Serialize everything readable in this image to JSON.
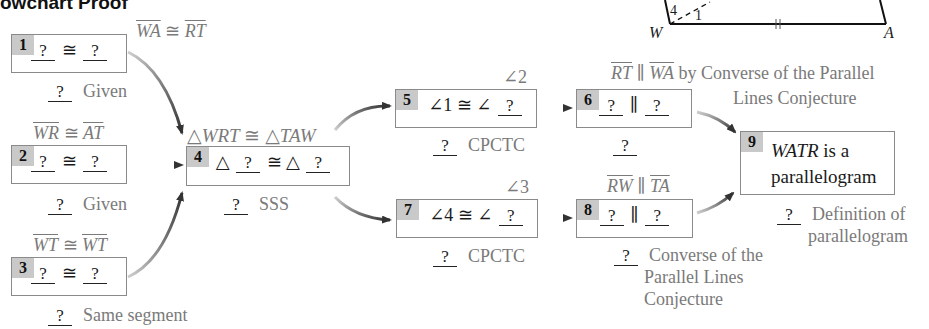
{
  "title": "owchart Proof",
  "blank": "?",
  "figure": {
    "vertex_labels": {
      "W": "W",
      "A": "A"
    },
    "angle_labels": {
      "a4": "4",
      "a1": "1"
    },
    "tick_mark": "||"
  },
  "boxes": [
    {
      "num": "1",
      "annotation": "WA ≅ RT",
      "statement_op": "≅",
      "reason": "Given"
    },
    {
      "num": "2",
      "annotation": "WR ≅ AT",
      "statement_op": "≅",
      "reason": "Given"
    },
    {
      "num": "3",
      "annotation": "WT ≅ WT",
      "statement_op": "≅",
      "reason": "Same segment"
    },
    {
      "num": "4",
      "annotation": "△WRT ≅ △TAW",
      "statement_op": "≅",
      "tri": "△",
      "reason": "SSS"
    },
    {
      "num": "5",
      "annotation": "∠2",
      "statement_left": "∠1",
      "statement_op": "≅",
      "angle": "∠",
      "reason": "CPCTC"
    },
    {
      "num": "6",
      "annotation_line1": "RT ∥ WA by Converse of the Parallel",
      "annotation_line2": "Lines Conjecture",
      "statement_op": "∥",
      "reason": ""
    },
    {
      "num": "7",
      "annotation": "∠3",
      "statement_left": "∠4",
      "statement_op": "≅",
      "angle": "∠",
      "reason": "CPCTC"
    },
    {
      "num": "8",
      "annotation": "RW ∥ TA",
      "statement_op": "∥",
      "reason_lines": [
        "Converse of the",
        "Parallel Lines",
        "Conjecture"
      ]
    },
    {
      "num": "9",
      "statement_line1_italic": "WATR",
      "statement_line1_rest": " is a",
      "statement_line2": "parallelogram",
      "reason_lines": [
        "Definition of",
        "parallelogram"
      ]
    }
  ],
  "annotation_parts": {
    "b1": {
      "s1": "WA",
      "op": "≅",
      "s2": "RT"
    },
    "b2": {
      "s1": "WR",
      "op": "≅",
      "s2": "AT"
    },
    "b3": {
      "s1": "WT",
      "op": "≅",
      "s2": "WT"
    },
    "b4": {
      "t1": "△",
      "n1": "WRT",
      "op": "≅",
      "t2": "△",
      "n2": "TAW"
    },
    "b6": {
      "s1": "RT",
      "op": "∥",
      "s2": "WA",
      "rest": " by Converse of the Parallel",
      "line2": "Lines Conjecture"
    },
    "b8": {
      "s1": "RW",
      "op": "∥",
      "s2": "TA"
    }
  },
  "colors": {
    "box_border": "#8a8a8a",
    "number_tab": "#c9c9c9",
    "annotation_text": "#7a7a7a",
    "arrow": "#444444"
  }
}
